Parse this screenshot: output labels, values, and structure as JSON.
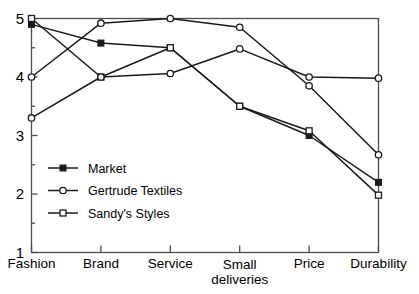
{
  "chart_data": {
    "type": "line",
    "title": "",
    "xlabel": "",
    "ylabel": "",
    "categories": [
      "Fashion",
      "Brand",
      "Service",
      "Small\ndeliveries",
      "Price",
      "Durability"
    ],
    "category_labels_flat": [
      "Fashion",
      "Brand",
      "Service",
      "Small deliveries",
      "Price",
      "Durability"
    ],
    "ylim": [
      1,
      5
    ],
    "yticks": [
      1,
      2,
      3,
      4,
      5
    ],
    "ytick_labels": [
      "1",
      "2",
      "3",
      "4",
      "5"
    ],
    "yminor_step": 0.5,
    "grid": false,
    "legend_position": "inside-lower-left",
    "series": [
      {
        "name": "Market",
        "marker": "filled-square",
        "values": [
          4.9,
          4.58,
          4.5,
          3.5,
          3.0,
          2.2
        ]
      },
      {
        "name": "Gertrude Textiles",
        "marker": "open-circle",
        "values": [
          4.0,
          4.92,
          5.0,
          4.85,
          3.85,
          2.67
        ]
      },
      {
        "name": "Sandy's Styles",
        "marker": "open-square",
        "values": [
          5.0,
          4.0,
          4.5,
          3.5,
          3.08,
          1.98
        ]
      },
      {
        "name": "Series 4",
        "marker": "open-circle",
        "values": [
          3.3,
          4.0,
          4.06,
          4.48,
          4.0,
          3.98
        ],
        "in_legend": false
      }
    ],
    "legend": [
      {
        "label": "Market",
        "marker": "filled-square"
      },
      {
        "label": "Gertrude Textiles",
        "marker": "open-circle"
      },
      {
        "label": "Sandy's Styles",
        "marker": "open-square"
      }
    ],
    "colors": {
      "line": "#1a1a1a",
      "axis": "#4d4d4d",
      "marker_fill": "#1a1a1a",
      "background": "#ffffff"
    }
  }
}
